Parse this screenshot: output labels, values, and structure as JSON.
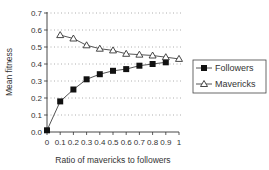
{
  "chart_data": {
    "type": "line",
    "title": "",
    "xlabel": "Ratio of mavericks to followers",
    "ylabel": "Mean fitness",
    "xlim": [
      0,
      1
    ],
    "ylim": [
      0,
      0.7
    ],
    "x_ticks": [
      "0",
      "0.1",
      "0.2",
      "0.3",
      "0.4",
      "0.5",
      "0.6",
      "0.7",
      "0.8",
      "0.9",
      "1"
    ],
    "y_ticks": [
      "0.0",
      "0.1",
      "0.2",
      "0.3",
      "0.4",
      "0.5",
      "0.6",
      "0.7"
    ],
    "grid": "horizontal dotted",
    "legend_position": "right",
    "series": [
      {
        "name": "Followers",
        "marker": "filled-square",
        "x": [
          0,
          0.1,
          0.2,
          0.3,
          0.4,
          0.5,
          0.6,
          0.7,
          0.8,
          0.9
        ],
        "values": [
          0.01,
          0.18,
          0.25,
          0.31,
          0.34,
          0.36,
          0.37,
          0.39,
          0.4,
          0.41
        ]
      },
      {
        "name": "Mavericks",
        "marker": "open-triangle",
        "x": [
          0.1,
          0.2,
          0.3,
          0.4,
          0.5,
          0.6,
          0.7,
          0.8,
          0.9,
          1.0
        ],
        "values": [
          0.57,
          0.55,
          0.51,
          0.49,
          0.48,
          0.46,
          0.455,
          0.45,
          0.44,
          0.43
        ]
      }
    ]
  },
  "legend": {
    "items": [
      {
        "label": "Followers"
      },
      {
        "label": "Mavericks"
      }
    ]
  }
}
